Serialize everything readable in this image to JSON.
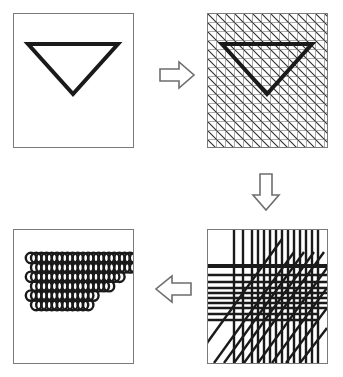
{
  "figure": {
    "background_color": "#ffffff",
    "ink_color": "#1a1a1a",
    "panel_border_color": "#7a7a7a",
    "arrow_stroke_color": "#6e6e6e",
    "width": 343,
    "height": 377
  },
  "panels": [
    {
      "id": "source",
      "name": "triangle-outline",
      "label": "Triangle outline",
      "position": "top-left",
      "shape": {
        "type": "triangle",
        "orientation": "pointing-down",
        "stroke_width": 4,
        "fill": "none",
        "vertices": [
          [
            14,
            30
          ],
          [
            104,
            30
          ],
          [
            59,
            80
          ]
        ]
      }
    },
    {
      "id": "grid",
      "name": "triangle-on-fine-grid",
      "label": "Triangle over fine sampling grid",
      "position": "top-right",
      "grid": {
        "type": "square-grid-with-diagonals",
        "cell_size": 9,
        "columns": 13,
        "rows": 15,
        "line_width": 1,
        "diagonal_direction": "down-right",
        "diagonal_spacing": 9
      },
      "shape": {
        "type": "triangle",
        "orientation": "pointing-down",
        "stroke_width": 4,
        "fill": "none",
        "vertices": [
          [
            14,
            30
          ],
          [
            104,
            30
          ],
          [
            59,
            80
          ]
        ]
      }
    },
    {
      "id": "lines",
      "name": "coarse-line-sampling",
      "label": "Coarse line sampling pattern",
      "position": "bottom-right",
      "pattern": {
        "type": "mixed-line-bundle",
        "vertical_x": [
          26,
          35,
          44,
          50,
          56,
          62,
          68,
          74,
          80,
          86,
          92,
          98,
          104,
          110
        ],
        "horizontal_y": [
          36,
          45,
          52,
          58,
          63,
          68,
          73,
          78,
          84,
          90
        ],
        "emphasized_horizontal_y": 36,
        "diagonal_count": 9,
        "diagonal_direction": "up-right",
        "line_width": 2,
        "emphasized_line_width": 4
      }
    },
    {
      "id": "dots",
      "name": "sampled-dot-triangle",
      "label": "Resampled dot pattern",
      "position": "bottom-left",
      "dots": {
        "type": "circle-lattice-triangle",
        "circle_radius": 5.2,
        "ring_width": 2.4,
        "fill": "none",
        "stroke": "#1a1a1a",
        "origin_x": 17,
        "origin_y": 28,
        "step_x": 10.4,
        "step_y": 9.4,
        "row_counts": [
          23,
          21,
          18,
          15,
          13,
          11
        ],
        "row_is_half_step": [
          false,
          true,
          false,
          true,
          false,
          true
        ]
      }
    }
  ],
  "arrows": [
    {
      "id": "arrow-right",
      "name": "arrow-right-icon",
      "direction": "right",
      "style": "hollow-block",
      "from_panel": "source",
      "to_panel": "grid"
    },
    {
      "id": "arrow-down",
      "name": "arrow-down-icon",
      "direction": "down",
      "style": "hollow-block",
      "from_panel": "grid",
      "to_panel": "lines"
    },
    {
      "id": "arrow-left",
      "name": "arrow-left-icon",
      "direction": "left",
      "style": "hollow-block",
      "from_panel": "lines",
      "to_panel": "dots"
    }
  ]
}
